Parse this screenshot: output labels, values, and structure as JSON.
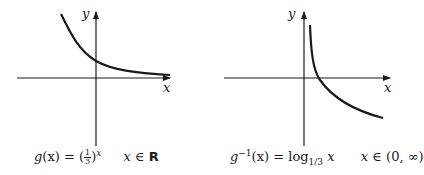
{
  "figures": [
    {
      "id": "left",
      "axis_labels": {
        "x": "x",
        "y": "y"
      },
      "caption": {
        "func": "g",
        "arg": "(x) = (",
        "frac_num": "1",
        "frac_den": "3",
        "close": ")",
        "exp": "x",
        "domain_var": "x",
        "domain_sym": "∈",
        "domain_set": "R"
      },
      "curve": "exponential decay, base 1/3"
    },
    {
      "id": "right",
      "axis_labels": {
        "x": "x",
        "y": "y"
      },
      "caption": {
        "func": "g",
        "sup": "−1",
        "arg": "(x) = log",
        "sub": "1/3",
        "var": "x",
        "domain_var": "x",
        "domain_sym": "∈",
        "domain_set": "(0, ∞)"
      },
      "curve": "logarithm, base 1/3"
    }
  ],
  "colors": {
    "ink": "#1a1a1a",
    "background": "#ffffff"
  }
}
